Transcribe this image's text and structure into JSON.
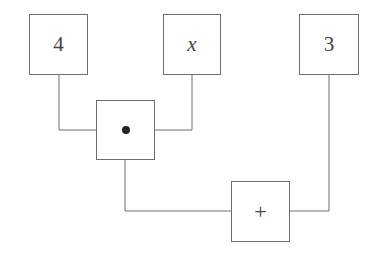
{
  "diagram": {
    "type": "expression-tree",
    "nodes": [
      {
        "id": "n4",
        "label": "4",
        "kind": "constant"
      },
      {
        "id": "nx",
        "label": "x",
        "kind": "variable"
      },
      {
        "id": "n3",
        "label": "3",
        "kind": "constant"
      },
      {
        "id": "mul",
        "label": "•",
        "kind": "operator",
        "meaning": "multiply"
      },
      {
        "id": "add",
        "label": "+",
        "kind": "operator",
        "meaning": "add"
      }
    ],
    "edges": [
      {
        "from": "n4",
        "to": "mul"
      },
      {
        "from": "nx",
        "to": "mul"
      },
      {
        "from": "mul",
        "to": "add"
      },
      {
        "from": "n3",
        "to": "add"
      }
    ],
    "colors": {
      "line": "#6e6e6e",
      "text": "#444444",
      "background": "#ffffff"
    }
  }
}
